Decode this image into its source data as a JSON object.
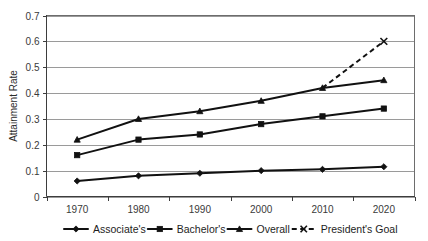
{
  "chart_data": {
    "type": "line",
    "title": "",
    "xlabel": "",
    "ylabel": "Attainment Rate",
    "categories": [
      "1970",
      "1980",
      "1990",
      "2000",
      "2010",
      "2020"
    ],
    "x": [
      1970,
      1980,
      1990,
      2000,
      2010,
      2020
    ],
    "ylim": [
      0,
      0.7
    ],
    "yticks": [
      "0",
      "0.1",
      "0.2",
      "0.3",
      "0.4",
      "0.5",
      "0.6",
      "0.7"
    ],
    "ytick_values": [
      0,
      0.1,
      0.2,
      0.3,
      0.4,
      0.5,
      0.6,
      0.7
    ],
    "grid": true,
    "legend_position": "bottom",
    "series": [
      {
        "name": "Associate's",
        "marker": "diamond",
        "linestyle": "solid",
        "values": [
          0.06,
          0.08,
          0.09,
          0.1,
          0.105,
          0.115
        ]
      },
      {
        "name": "Bachelor's",
        "marker": "square",
        "linestyle": "solid",
        "values": [
          0.16,
          0.22,
          0.24,
          0.28,
          0.31,
          0.34
        ]
      },
      {
        "name": "Overall",
        "marker": "triangle",
        "linestyle": "solid",
        "values": [
          0.22,
          0.3,
          0.33,
          0.37,
          0.42,
          0.45
        ]
      },
      {
        "name": "President's Goal",
        "marker": "x",
        "linestyle": "dashed",
        "values": [
          null,
          null,
          null,
          null,
          0.42,
          0.6
        ]
      }
    ]
  },
  "axes": {
    "y_title": "Attainment Rate",
    "y_tick_labels": [
      "0.7",
      "0.6",
      "0.5",
      "0.4",
      "0.3",
      "0.2",
      "0.1",
      "0"
    ],
    "x_tick_labels": [
      "1970",
      "1980",
      "1990",
      "2000",
      "2010",
      "2020"
    ]
  },
  "legend": {
    "items": [
      {
        "label": "Associate's",
        "marker": "diamond",
        "linestyle": "solid"
      },
      {
        "label": "Bachelor's",
        "marker": "square",
        "linestyle": "solid"
      },
      {
        "label": "Overall",
        "marker": "triangle",
        "linestyle": "solid"
      },
      {
        "label": "President's Goal",
        "marker": "x",
        "linestyle": "dashed"
      }
    ]
  },
  "colors": {
    "series": "#111111",
    "grid": "#9a9a9a",
    "frame": "#6d6d6d",
    "text": "#1d1d1d",
    "background": "#ffffff"
  }
}
